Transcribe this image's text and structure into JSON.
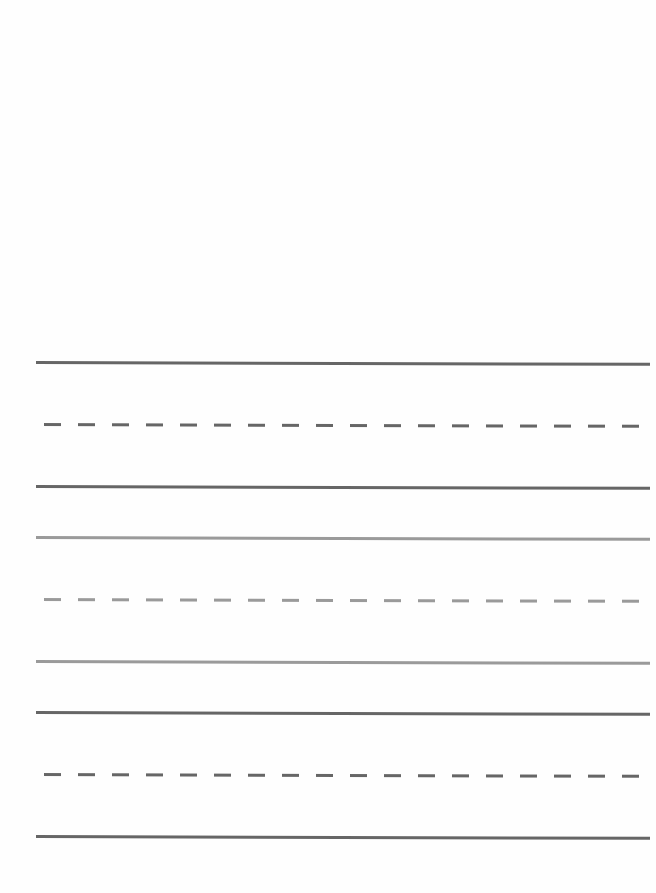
{
  "sheet": {
    "type": "handwriting-practice-sheet",
    "blank_header_area": true,
    "line_groups": [
      {
        "name": "group-1",
        "shade": "dark",
        "color": "#666666",
        "lines": [
          {
            "style": "solid",
            "y": 362
          },
          {
            "style": "dashed",
            "y": 424
          },
          {
            "style": "solid",
            "y": 486
          }
        ]
      },
      {
        "name": "group-2",
        "shade": "light",
        "color": "#9a9a9a",
        "lines": [
          {
            "style": "solid",
            "y": 537
          },
          {
            "style": "dashed",
            "y": 599
          },
          {
            "style": "solid",
            "y": 661
          }
        ]
      },
      {
        "name": "group-3",
        "shade": "dark",
        "color": "#666666",
        "lines": [
          {
            "style": "solid",
            "y": 712
          },
          {
            "style": "dashed",
            "y": 774
          },
          {
            "style": "solid",
            "y": 836
          }
        ]
      }
    ],
    "line_left_x": 36,
    "line_right_x": 650
  }
}
